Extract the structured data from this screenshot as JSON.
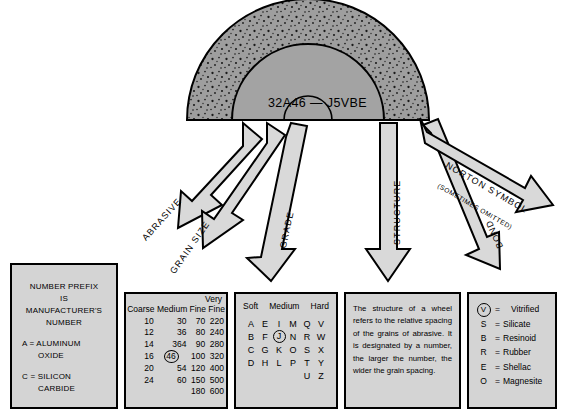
{
  "diagram": {
    "wheel": {
      "code": "32A46 — J5VBE",
      "fill": "#9e9e9e",
      "hub_fill": "#a8a8a8"
    },
    "arrows": [
      {
        "name": "abrasive",
        "label": "ABRASIVE"
      },
      {
        "name": "grain-size",
        "label": "GRAIN SIZE"
      },
      {
        "name": "grade",
        "label": "GRADE"
      },
      {
        "name": "structure",
        "label": "STRUCTURE"
      },
      {
        "name": "bond",
        "label": "BOND"
      },
      {
        "name": "norton-symbol",
        "label": "NORTON SYMBOL",
        "sublabel": "(SOMETIMES OMITTED)"
      }
    ]
  },
  "prefix_box": {
    "line1": "NUMBER PREFIX",
    "line2": "IS",
    "line3": "MANUFACTURER'S",
    "line4": "NUMBER",
    "defs": [
      {
        "code": "A = ALUMINUM",
        "cont": "OXIDE"
      },
      {
        "code": "C = SILICON",
        "cont": "CARBIDE"
      }
    ]
  },
  "grain_box": {
    "very_label": "Very",
    "headers": [
      "Coarse",
      "Medium",
      "Fine",
      "Fine"
    ],
    "rows": [
      [
        "10",
        "30",
        "70",
        "220"
      ],
      [
        "12",
        "36",
        "80",
        "240"
      ],
      [
        "14",
        "364",
        "90",
        "280"
      ],
      [
        "16",
        "46",
        "100",
        "320"
      ],
      [
        "20",
        "54",
        "120",
        "400"
      ],
      [
        "24",
        "60",
        "150",
        "500"
      ],
      [
        "",
        "",
        "180",
        "600"
      ]
    ],
    "circled_value": "46",
    "circled_row": 3,
    "circled_col": 1
  },
  "grade_box": {
    "headers": [
      "Soft",
      "Medium",
      "Hard"
    ],
    "rows": [
      [
        "A",
        "E",
        "I",
        "M",
        "Q",
        "V"
      ],
      [
        "B",
        "F",
        "J",
        "N",
        "R",
        "W"
      ],
      [
        "C",
        "G",
        "K",
        "O",
        "S",
        "X"
      ],
      [
        "D",
        "H",
        "L",
        "P",
        "T",
        "Y"
      ],
      [
        "",
        "",
        "",
        "",
        "U",
        "Z"
      ]
    ],
    "circled_value": "J"
  },
  "structure_box": {
    "text": "The structure of a wheel refers to the relative spacing of the grains of abrasive. It is designated by a number, the larger the number, the wider the grain spacing."
  },
  "bond_box": {
    "rows": [
      {
        "symbol": "V",
        "circled": true,
        "eq": "=",
        "name": "Vitrified"
      },
      {
        "symbol": "S",
        "circled": false,
        "eq": "=",
        "name": "Silicate"
      },
      {
        "symbol": "B",
        "circled": false,
        "eq": "=",
        "name": "Resinoid"
      },
      {
        "symbol": "R",
        "circled": false,
        "eq": "=",
        "name": "Rubber"
      },
      {
        "symbol": "E",
        "circled": false,
        "eq": "=",
        "name": "Shellac"
      },
      {
        "symbol": "O",
        "circled": false,
        "eq": "=",
        "name": "Magnesite"
      }
    ]
  },
  "colors": {
    "box_fill": "#d4d4d4",
    "wheel_gray": "#9e9e9e",
    "arrow_fill": "#d9d9d9",
    "outline": "#000000"
  }
}
